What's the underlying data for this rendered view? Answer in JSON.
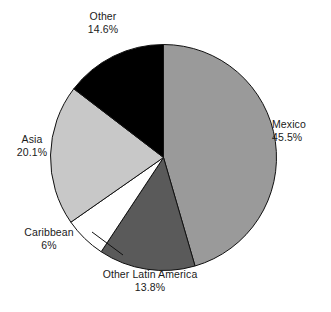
{
  "chart_data": {
    "type": "pie",
    "title": "",
    "subtitle": "",
    "xlabel": "",
    "ylabel": "",
    "legend_position": "none",
    "grid": false,
    "start_angle_deg": 0,
    "direction": "clockwise",
    "categories": [
      "Mexico",
      "Other Latin America",
      "Caribbean",
      "Asia",
      "Other"
    ],
    "values": [
      45.5,
      13.8,
      6,
      20.1,
      14.6
    ],
    "unit": "%",
    "slices": [
      {
        "label": "Mexico",
        "value": 45.5,
        "value_text": "45.5%",
        "color": "#9a9a9a",
        "start_pct": 0,
        "end_pct": 45.5
      },
      {
        "label": "Other Latin America",
        "value": 13.8,
        "value_text": "13.8%",
        "color": "#5a5a5a",
        "start_pct": 45.5,
        "end_pct": 59.3
      },
      {
        "label": "Caribbean",
        "value": 6,
        "value_text": "6%",
        "color": "#ffffff",
        "start_pct": 59.3,
        "end_pct": 65.3
      },
      {
        "label": "Asia",
        "value": 20.1,
        "value_text": "20.1%",
        "color": "#c8c8c8",
        "start_pct": 65.3,
        "end_pct": 85.4
      },
      {
        "label": "Other",
        "value": 14.6,
        "value_text": "14.6%",
        "color": "#000000",
        "start_pct": 85.4,
        "end_pct": 100
      }
    ],
    "outline_color": "#111111",
    "background_color": "#ffffff"
  },
  "labels": {
    "mexico": {
      "name": "Mexico",
      "pct": "45.5%"
    },
    "other_latin_america": {
      "name": "Other Latin America",
      "pct": "13.8%"
    },
    "caribbean": {
      "name": "Caribbean",
      "pct": "6%"
    },
    "asia": {
      "name": "Asia",
      "pct": "20.1%"
    },
    "other": {
      "name": "Other",
      "pct": "14.6%"
    }
  }
}
